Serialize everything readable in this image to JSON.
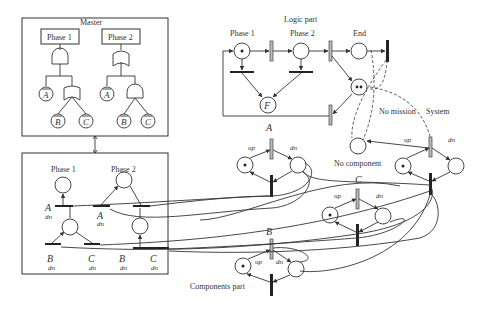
{
  "master": {
    "title": "Master",
    "phase1": {
      "label": "Phase 1",
      "gate": "AND",
      "children": [
        "Ā",
        "OR(B̄, C̄)"
      ]
    },
    "phase2": {
      "label": "Phase 2",
      "gate": "OR",
      "children": [
        "Ā",
        "AND(B̄, C̄)"
      ]
    },
    "leaves": {
      "a": "A",
      "b": "B",
      "c": "C"
    }
  },
  "phase_block": {
    "phase1_label": "Phase 1",
    "phase2_label": "Phase 2",
    "labels": {
      "a1": "A",
      "a1_state": "dn",
      "a2": "A",
      "a2_state": "dn",
      "b1": "B",
      "b1_state": "dn",
      "c1": "C",
      "c1_state": "dn",
      "b2": "B",
      "b2_state": "dn",
      "c2": "C",
      "c2_state": "dn"
    }
  },
  "logic": {
    "title": "Logic part",
    "phase1": "Phase 1",
    "phase2": "Phase 2",
    "end": "End",
    "failure": "F",
    "no_mission": "No mission",
    "system": "System",
    "no_component": "No component",
    "up": "up",
    "dn": "dn"
  },
  "components": {
    "title": "Components part",
    "a": {
      "name": "A",
      "up": "up",
      "dn": "dn"
    },
    "b": {
      "name": "B",
      "up": "up",
      "dn": "dn"
    },
    "c": {
      "name": "C",
      "up": "up",
      "dn": "dn"
    }
  }
}
